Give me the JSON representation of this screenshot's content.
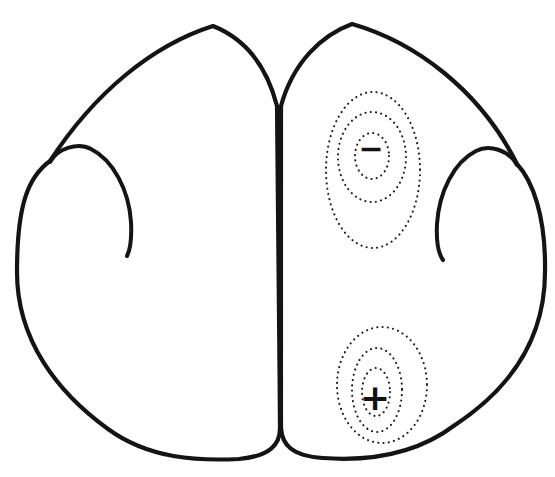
{
  "figure": {
    "background_color": "#ffffff",
    "outline_color": "#141414",
    "contour_color": "#1c1c1c",
    "label_color": "#111111",
    "negative_focus": {
      "label": "−",
      "rings": 3
    },
    "positive_focus": {
      "label": "+",
      "rings": 3
    }
  }
}
